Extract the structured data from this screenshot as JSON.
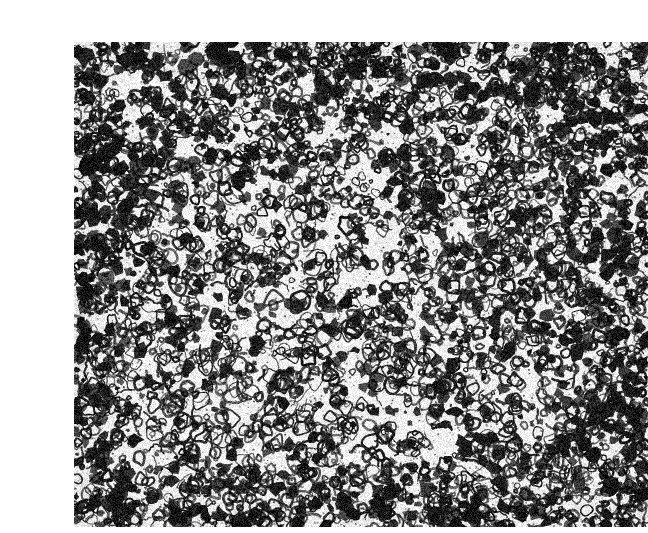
{
  "page": {
    "width": 635,
    "height": 533,
    "background_color": "#ffffff",
    "content_type": "grayscale-micrograph",
    "caption": ""
  },
  "figure": {
    "name": "metallographic-micrograph",
    "x": 34,
    "y": 26,
    "width": 574,
    "height": 485,
    "base_color": "#f4f3f0",
    "ink_color": "#161616",
    "texture": {
      "grain_noise_opacity": 0.24,
      "vignette_strength": 0.18
    },
    "density_map": {
      "note": "Relative feature density across the frame, 0 = sparse/light, 1 = dense/dark",
      "regions": [
        {
          "name": "top-left",
          "cx": 0.12,
          "cy": 0.12,
          "radius": 0.32,
          "density": 0.95
        },
        {
          "name": "top-center",
          "cx": 0.42,
          "cy": 0.1,
          "radius": 0.28,
          "density": 0.8
        },
        {
          "name": "top-right",
          "cx": 0.82,
          "cy": 0.14,
          "radius": 0.3,
          "density": 0.92
        },
        {
          "name": "left-mid",
          "cx": 0.08,
          "cy": 0.45,
          "radius": 0.26,
          "density": 0.78
        },
        {
          "name": "center",
          "cx": 0.45,
          "cy": 0.48,
          "radius": 0.3,
          "density": 0.45
        },
        {
          "name": "center-left-light",
          "cx": 0.3,
          "cy": 0.62,
          "radius": 0.24,
          "density": 0.3
        },
        {
          "name": "right-mid",
          "cx": 0.86,
          "cy": 0.5,
          "radius": 0.26,
          "density": 0.82
        },
        {
          "name": "bottom-left",
          "cx": 0.14,
          "cy": 0.86,
          "radius": 0.28,
          "density": 0.86
        },
        {
          "name": "bottom-center",
          "cx": 0.5,
          "cy": 0.9,
          "radius": 0.26,
          "density": 0.7
        },
        {
          "name": "bottom-right",
          "cx": 0.84,
          "cy": 0.86,
          "radius": 0.3,
          "density": 0.9
        }
      ]
    },
    "features": {
      "ring_count": 2600,
      "blob_count": 1500,
      "filament_count": 900,
      "ring_radius_px": [
        2,
        11
      ],
      "blob_radius_px": [
        1,
        6
      ],
      "stroke_width_px": [
        1,
        3
      ]
    },
    "random_seed": 20240517
  }
}
